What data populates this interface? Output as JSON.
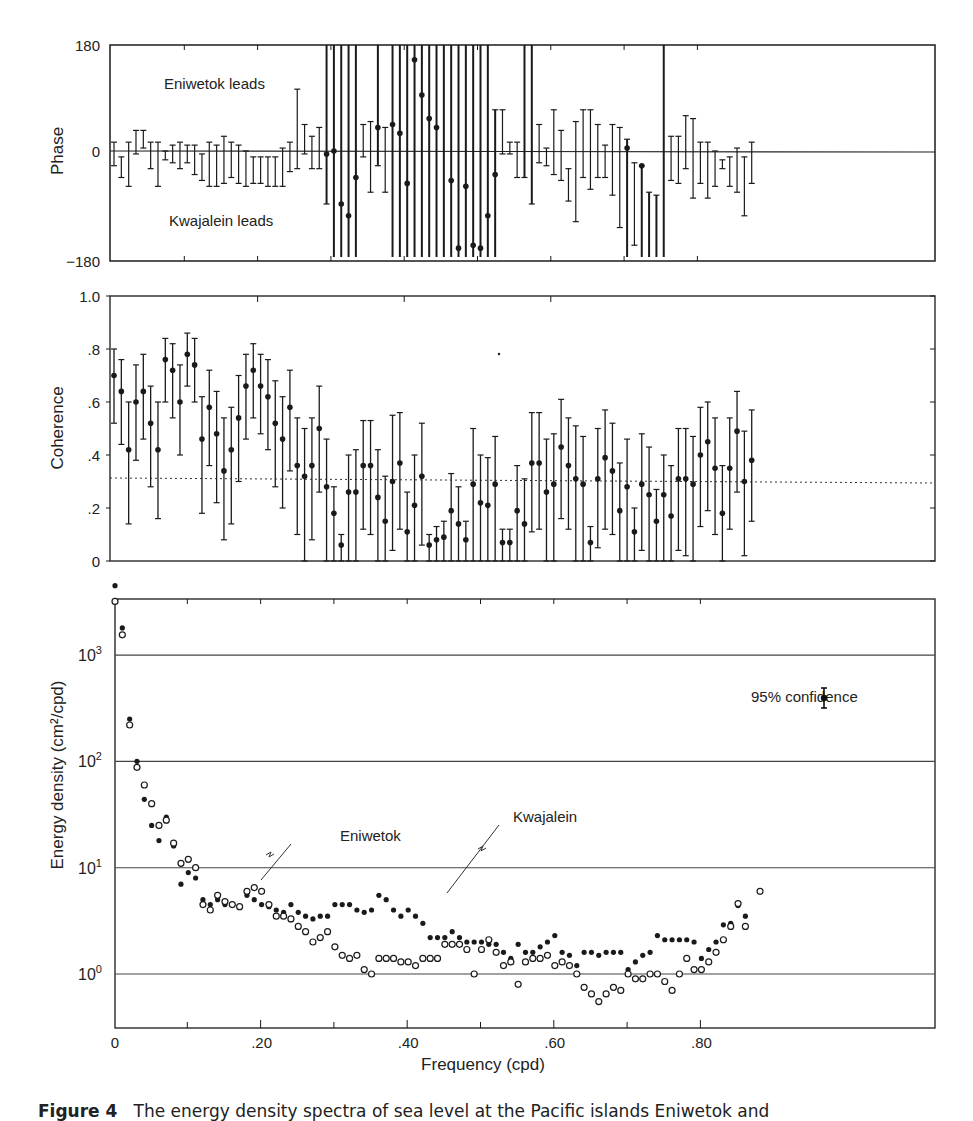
{
  "figure": {
    "caption_prefix": "Figure 4",
    "caption_text": "The energy density spectra of sea level at the Pacific islands Eniwetok and"
  },
  "chart_data": [
    {
      "type": "scatter",
      "panel": "phase",
      "title": "",
      "xlabel": "",
      "ylabel": "Phase",
      "ylim": [
        -180,
        180
      ],
      "yticks": [
        "180",
        "0",
        "−180"
      ],
      "annotations": [
        "Eniwetok leads",
        "Kwajalein leads"
      ],
      "grid": false,
      "x": [
        0.0,
        0.01,
        0.02,
        0.03,
        0.04,
        0.05,
        0.06,
        0.07,
        0.08,
        0.09,
        0.1,
        0.11,
        0.12,
        0.13,
        0.14,
        0.15,
        0.16,
        0.17,
        0.18,
        0.19,
        0.2,
        0.21,
        0.22,
        0.23,
        0.24,
        0.25,
        0.26,
        0.27,
        0.28,
        0.29,
        0.3,
        0.31,
        0.32,
        0.33,
        0.34,
        0.35,
        0.36,
        0.37,
        0.38,
        0.39,
        0.4,
        0.41,
        0.42,
        0.43,
        0.44,
        0.45,
        0.46,
        0.47,
        0.48,
        0.49,
        0.5,
        0.51,
        0.52,
        0.53,
        0.54,
        0.55,
        0.56,
        0.57,
        0.58,
        0.59,
        0.6,
        0.61,
        0.62,
        0.63,
        0.64,
        0.65,
        0.66,
        0.67,
        0.68,
        0.69,
        0.7,
        0.71,
        0.72,
        0.73,
        0.74,
        0.75,
        0.76,
        0.77,
        0.78,
        0.79,
        0.8,
        0.81,
        0.82,
        0.83,
        0.84,
        0.85,
        0.86,
        0.87
      ],
      "values": [
        0,
        -10,
        0,
        20,
        25,
        0,
        0,
        0,
        -5,
        0,
        0,
        -10,
        -15,
        -10,
        -5,
        -10,
        0,
        -5,
        -10,
        -5,
        -10,
        -15,
        -20,
        -20,
        -20,
        0,
        40,
        0,
        0,
        -5,
        0,
        -90,
        -110,
        -45,
        40,
        -20,
        40,
        -25,
        45,
        30,
        -55,
        155,
        95,
        55,
        40,
        null,
        -50,
        -165,
        -60,
        -160,
        -165,
        -110,
        -40,
        null,
        null,
        null,
        null,
        null,
        null,
        null,
        -15,
        null,
        null,
        -15,
        null,
        null,
        -80,
        null,
        null,
        -10,
        5,
        -10,
        -25,
        null,
        null,
        null,
        null,
        null,
        null,
        null,
        null,
        -35,
        null,
        null,
        null,
        null,
        null,
        null
      ],
      "error_low": [
        -25,
        -45,
        -60,
        -5,
        5,
        -30,
        -60,
        -15,
        -20,
        -30,
        -20,
        -40,
        -50,
        -60,
        -60,
        -55,
        -45,
        -55,
        -60,
        -55,
        -55,
        -60,
        -60,
        -60,
        -35,
        -30,
        -5,
        -30,
        -30,
        -90,
        -180,
        -180,
        -180,
        -180,
        -10,
        -70,
        -25,
        -70,
        -180,
        -180,
        -180,
        -180,
        -180,
        -180,
        -180,
        -180,
        -180,
        -180,
        -180,
        -180,
        -180,
        -180,
        -180,
        -5,
        -5,
        -45,
        -45,
        -90,
        -20,
        -25,
        -40,
        -50,
        -85,
        -120,
        -45,
        -65,
        -45,
        -45,
        -75,
        -130,
        -180,
        -160,
        -180,
        -180,
        -180,
        -180,
        -50,
        -55,
        -30,
        -80,
        -55,
        -80,
        -60,
        -30,
        -60,
        -70,
        -110,
        -55
      ],
      "error_high": [
        15,
        -10,
        15,
        35,
        35,
        15,
        15,
        0,
        10,
        15,
        10,
        10,
        -5,
        15,
        10,
        25,
        15,
        10,
        0,
        -10,
        -10,
        -10,
        -10,
        5,
        15,
        105,
        45,
        25,
        40,
        180,
        180,
        180,
        180,
        180,
        45,
        50,
        180,
        40,
        180,
        180,
        180,
        180,
        180,
        180,
        180,
        180,
        180,
        180,
        180,
        180,
        180,
        180,
        70,
        70,
        15,
        15,
        180,
        180,
        45,
        5,
        70,
        35,
        -30,
        50,
        70,
        70,
        45,
        10,
        45,
        40,
        20,
        -20,
        -25,
        -70,
        -75,
        180,
        25,
        25,
        60,
        55,
        15,
        15,
        0,
        -15,
        -10,
        5,
        -10,
        15
      ]
    },
    {
      "type": "scatter",
      "panel": "coherence",
      "title": "",
      "xlabel": "",
      "ylabel": "Coherence",
      "ylim": [
        0,
        1.0
      ],
      "yticks": [
        "0",
        ".2",
        ".4",
        ".6",
        ".8",
        "1.0"
      ],
      "reference_line": {
        "y": 0.31,
        "style": "dotted",
        "label": "significance level"
      },
      "grid": false,
      "x": [
        0.0,
        0.01,
        0.02,
        0.03,
        0.04,
        0.05,
        0.06,
        0.07,
        0.08,
        0.09,
        0.1,
        0.11,
        0.12,
        0.13,
        0.14,
        0.15,
        0.16,
        0.17,
        0.18,
        0.19,
        0.2,
        0.21,
        0.22,
        0.23,
        0.24,
        0.25,
        0.26,
        0.27,
        0.28,
        0.29,
        0.3,
        0.31,
        0.32,
        0.33,
        0.34,
        0.35,
        0.36,
        0.37,
        0.38,
        0.39,
        0.4,
        0.41,
        0.42,
        0.43,
        0.44,
        0.45,
        0.46,
        0.47,
        0.48,
        0.49,
        0.5,
        0.51,
        0.52,
        0.53,
        0.54,
        0.55,
        0.56,
        0.57,
        0.58,
        0.59,
        0.6,
        0.61,
        0.62,
        0.63,
        0.64,
        0.65,
        0.66,
        0.67,
        0.68,
        0.69,
        0.7,
        0.71,
        0.72,
        0.73,
        0.74,
        0.75,
        0.76,
        0.77,
        0.78,
        0.79,
        0.8,
        0.81,
        0.82,
        0.83,
        0.84,
        0.85,
        0.86,
        0.87
      ],
      "values": [
        0.7,
        0.64,
        0.42,
        0.6,
        0.64,
        0.52,
        0.42,
        0.76,
        0.72,
        0.6,
        0.78,
        0.74,
        0.46,
        0.58,
        0.48,
        0.34,
        0.42,
        0.54,
        0.66,
        0.72,
        0.66,
        0.62,
        0.52,
        0.46,
        0.58,
        0.36,
        0.32,
        0.36,
        0.5,
        0.28,
        0.18,
        0.06,
        0.26,
        0.26,
        0.36,
        0.36,
        0.24,
        0.15,
        0.3,
        0.37,
        0.11,
        0.21,
        0.32,
        0.06,
        0.08,
        0.09,
        0.19,
        0.14,
        0.08,
        0.29,
        0.22,
        0.21,
        0.29,
        0.07,
        0.07,
        0.19,
        0.14,
        0.37,
        0.37,
        0.26,
        0.29,
        0.43,
        0.36,
        0.31,
        0.29,
        0.07,
        0.31,
        0.39,
        0.34,
        0.19,
        0.28,
        0.11,
        0.29,
        0.25,
        0.15,
        0.25,
        0.17,
        0.31,
        0.31,
        0.29,
        0.4,
        0.45,
        0.35,
        0.18,
        0.35,
        0.49,
        0.3,
        0.38
      ],
      "error_low": [
        0.52,
        0.44,
        0.14,
        0.38,
        0.46,
        0.28,
        0.16,
        0.6,
        0.54,
        0.4,
        0.66,
        0.6,
        0.18,
        0.36,
        0.22,
        0.08,
        0.14,
        0.3,
        0.46,
        0.54,
        0.48,
        0.42,
        0.28,
        0.2,
        0.34,
        0.1,
        0.0,
        0.08,
        0.26,
        0.0,
        0.0,
        0.0,
        0.0,
        0.0,
        0.12,
        0.1,
        0.0,
        0.0,
        0.04,
        0.12,
        0.0,
        0.0,
        0.06,
        0.0,
        0.0,
        0.0,
        0.0,
        0.0,
        0.0,
        0.0,
        0.0,
        0.0,
        0.0,
        0.0,
        0.0,
        0.0,
        0.0,
        0.11,
        0.12,
        0.0,
        0.0,
        0.16,
        0.12,
        0.0,
        0.0,
        0.0,
        0.05,
        0.12,
        0.1,
        0.0,
        0.0,
        0.0,
        0.04,
        0.0,
        0.0,
        0.0,
        0.0,
        0.04,
        0.02,
        0.0,
        0.13,
        0.19,
        0.1,
        0.0,
        0.12,
        0.26,
        0.02,
        0.15
      ],
      "error_high": [
        0.8,
        0.76,
        0.6,
        0.74,
        0.78,
        0.66,
        0.6,
        0.84,
        0.82,
        0.74,
        0.86,
        0.84,
        0.62,
        0.72,
        0.64,
        0.54,
        0.58,
        0.7,
        0.78,
        0.82,
        0.78,
        0.76,
        0.68,
        0.62,
        0.72,
        0.54,
        0.5,
        0.54,
        0.66,
        0.46,
        0.28,
        0.1,
        0.4,
        0.42,
        0.53,
        0.53,
        0.42,
        0.32,
        0.55,
        0.56,
        0.26,
        0.4,
        0.52,
        0.1,
        0.13,
        0.15,
        0.33,
        0.28,
        0.15,
        0.5,
        0.4,
        0.39,
        0.47,
        0.12,
        0.12,
        0.36,
        0.31,
        0.56,
        0.56,
        0.46,
        0.48,
        0.61,
        0.54,
        0.51,
        0.47,
        0.13,
        0.5,
        0.57,
        0.52,
        0.37,
        0.46,
        0.2,
        0.48,
        0.43,
        0.27,
        0.4,
        0.36,
        0.5,
        0.5,
        0.47,
        0.58,
        0.6,
        0.54,
        0.36,
        0.54,
        0.64,
        0.49,
        0.57
      ]
    },
    {
      "type": "scatter",
      "panel": "energy_density",
      "title": "",
      "xlabel": "Frequency (cpd)",
      "ylabel": "Energy density (cm²/cpd)",
      "yscale": "log",
      "ylim": [
        0.3,
        3500
      ],
      "yticks": [
        "10⁰",
        "10¹",
        "10²",
        "10³"
      ],
      "xlim": [
        0,
        0.89
      ],
      "xticks": [
        "0",
        ".20",
        ".40",
        ".60",
        ".80"
      ],
      "grid": "horizontal at decades",
      "annotations": [
        "95% confidence",
        "Eniwetok",
        "Kwajalein"
      ],
      "legend": [
        {
          "name": "Eniwetok",
          "marker": "open circle"
        },
        {
          "name": "Kwajalein",
          "marker": "filled circle"
        }
      ],
      "x": [
        0.0,
        0.01,
        0.02,
        0.03,
        0.04,
        0.05,
        0.06,
        0.07,
        0.08,
        0.09,
        0.1,
        0.11,
        0.12,
        0.13,
        0.14,
        0.15,
        0.16,
        0.17,
        0.18,
        0.19,
        0.2,
        0.21,
        0.22,
        0.23,
        0.24,
        0.25,
        0.26,
        0.27,
        0.28,
        0.29,
        0.3,
        0.31,
        0.32,
        0.33,
        0.34,
        0.35,
        0.36,
        0.37,
        0.38,
        0.39,
        0.4,
        0.41,
        0.42,
        0.43,
        0.44,
        0.45,
        0.46,
        0.47,
        0.48,
        0.49,
        0.5,
        0.51,
        0.52,
        0.53,
        0.54,
        0.55,
        0.56,
        0.57,
        0.58,
        0.59,
        0.6,
        0.61,
        0.62,
        0.63,
        0.64,
        0.65,
        0.66,
        0.67,
        0.68,
        0.69,
        0.7,
        0.71,
        0.72,
        0.73,
        0.74,
        0.75,
        0.76,
        0.77,
        0.78,
        0.79,
        0.8,
        0.81,
        0.82,
        0.83,
        0.84,
        0.85,
        0.86,
        0.87,
        0.88
      ],
      "series": [
        {
          "name": "Kwajalein",
          "marker": "filled",
          "values": [
            4500,
            1800,
            250,
            100,
            44,
            25,
            18,
            30,
            16,
            7,
            9,
            8,
            5,
            4.5,
            5,
            4.5,
            4.5,
            null,
            5.5,
            5,
            4.5,
            4.3,
            4,
            3.8,
            4.5,
            3.8,
            3.5,
            3.3,
            3.5,
            3.5,
            4.5,
            4.5,
            4.5,
            4,
            3.8,
            4,
            5.5,
            5,
            4,
            3.5,
            4,
            3.5,
            3,
            2.2,
            2.2,
            2.2,
            2.5,
            2.2,
            2,
            2,
            2,
            1.9,
            1.9,
            1.6,
            1.4,
            1.9,
            1.6,
            1.6,
            1.8,
            2,
            2.3,
            1.6,
            1.5,
            1.2,
            1.6,
            1.6,
            1.5,
            1.6,
            1.6,
            1.6,
            1.1,
            1.3,
            1.5,
            1.6,
            2.3,
            2.1,
            2.1,
            2.1,
            2.1,
            2,
            1.4,
            1.7,
            2,
            2.9,
            3,
            4.4,
            3.5,
            null,
            null
          ]
        },
        {
          "name": "Eniwetok",
          "marker": "open",
          "values": [
            3200,
            1550,
            220,
            88,
            60,
            40,
            25,
            28,
            17,
            11,
            12,
            10,
            4.5,
            4,
            5.5,
            4.8,
            4.5,
            4.3,
            6,
            6.5,
            6,
            4.5,
            3.5,
            3.5,
            3.3,
            2.8,
            2.5,
            2,
            2.2,
            2.5,
            1.8,
            1.5,
            1.4,
            1.5,
            1.1,
            1.0,
            1.4,
            1.4,
            1.4,
            1.3,
            1.3,
            1.2,
            1.4,
            1.4,
            1.4,
            1.9,
            1.9,
            1.9,
            1.7,
            1.0,
            1.7,
            2.1,
            1.6,
            1.2,
            1.3,
            0.8,
            1.3,
            1.4,
            1.4,
            1.5,
            1.2,
            1.3,
            1.2,
            1.0,
            0.75,
            0.65,
            0.55,
            0.65,
            0.75,
            0.7,
            1.0,
            0.9,
            0.9,
            1.0,
            1.0,
            0.85,
            0.7,
            1.0,
            1.4,
            1.1,
            1.1,
            1.3,
            1.6,
            2.1,
            2.8,
            4.6,
            2.8,
            null,
            6
          ]
        }
      ]
    }
  ],
  "labels": {
    "phase_ylabel": "Phase",
    "phase_tick_top": "180",
    "phase_tick_mid": "0",
    "phase_tick_bot": "−180",
    "phase_note_top": "Eniwetok leads",
    "phase_note_bot": "Kwajalein leads",
    "coh_ylabel": "Coherence",
    "coh_ticks": [
      "0",
      ".2",
      ".4",
      ".6",
      ".8",
      "1.0"
    ],
    "energy_ylabel": "Energy density (cm²/cpd)",
    "energy_tick_base": "10",
    "energy_tick_exps": [
      "0",
      "1",
      "2",
      "3"
    ],
    "confidence_label": "95% confidence",
    "eniwetok_label": "Eniwetok",
    "kwajalein_label": "Kwajalein",
    "xlabel": "Frequency (cpd)",
    "xticks": [
      "0",
      ".20",
      ".40",
      ".60",
      ".80"
    ]
  },
  "style": {
    "ink": "#1a1a1a",
    "frame": "#2a2a2a",
    "gridline": "#444444",
    "background": "#ffffff"
  }
}
